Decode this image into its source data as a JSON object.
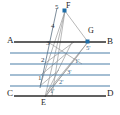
{
  "figure": {
    "width": 120,
    "height": 115,
    "background": "#ffffff",
    "colors": {
      "baseline": "#2b2b2b",
      "parallel": "#4a7fa8",
      "construction": "#8e8e8e",
      "marker": "#1f6ea8",
      "label": "#1a1a1a",
      "prime_label": "#2f5f86"
    },
    "baselines": [
      {
        "name": "line-AB",
        "left_label": "A",
        "right_label": "B",
        "y": 42,
        "x1": 14,
        "x2": 106,
        "color": "#2b2b2b",
        "width": 1.6
      },
      {
        "name": "line-CD",
        "left_label": "C",
        "right_label": "D",
        "y": 96,
        "x1": 14,
        "x2": 106,
        "color": "#2b2b2b",
        "width": 1.6
      }
    ],
    "parallels": [
      {
        "name": "parallel-1",
        "y": 53,
        "x1": 10,
        "x2": 110,
        "color": "#4a7fa8"
      },
      {
        "name": "parallel-2",
        "y": 64,
        "x1": 10,
        "x2": 110,
        "color": "#4a7fa8"
      },
      {
        "name": "parallel-3",
        "y": 75,
        "x1": 10,
        "x2": 110,
        "color": "#4a7fa8"
      },
      {
        "name": "parallel-4",
        "y": 86,
        "x1": 10,
        "x2": 110,
        "color": "#4a7fa8"
      }
    ],
    "points": [
      {
        "name": "point-F",
        "label": "F",
        "x": 65,
        "y": 11,
        "marked": true
      },
      {
        "name": "point-G",
        "label": "G",
        "x": 88,
        "y": 42,
        "marked": true
      },
      {
        "name": "point-E",
        "label": "E",
        "x": 45,
        "y": 96,
        "marked": false
      }
    ],
    "endpoint_labels": [
      {
        "name": "label-A",
        "text": "A",
        "x": 8,
        "y": 37
      },
      {
        "name": "label-B",
        "text": "B",
        "x": 107,
        "y": 38
      },
      {
        "name": "label-C",
        "text": "C",
        "x": 8,
        "y": 90
      },
      {
        "name": "label-D",
        "text": "D",
        "x": 107,
        "y": 90
      },
      {
        "name": "label-F",
        "text": "F",
        "x": 67,
        "y": 3
      },
      {
        "name": "label-G",
        "text": "G",
        "x": 89,
        "y": 28
      },
      {
        "name": "label-E",
        "text": "E",
        "x": 42,
        "y": 100
      }
    ],
    "division_labels": [
      {
        "name": "division-5",
        "text": "5",
        "x": 55,
        "y": 4
      },
      {
        "name": "division-4",
        "text": "4",
        "x": 52,
        "y": 24
      },
      {
        "name": "division-3",
        "text": "3",
        "x": 47,
        "y": 41
      },
      {
        "name": "division-2",
        "text": "2",
        "x": 42,
        "y": 58
      },
      {
        "name": "division-1",
        "text": "1",
        "x": 39,
        "y": 76
      }
    ],
    "prime_labels": [
      {
        "name": "division-5-prime",
        "text": "5'",
        "x": 87,
        "y": 46
      },
      {
        "name": "division-1-prime",
        "text": "1'",
        "x": 76,
        "y": 59
      },
      {
        "name": "division-3-prime",
        "text": "3'",
        "x": 68,
        "y": 70
      },
      {
        "name": "division-2-prime",
        "text": "2'",
        "x": 60,
        "y": 80
      },
      {
        "name": "division-1-prime-lower",
        "text": "1'",
        "x": 51,
        "y": 89
      }
    ],
    "construction_lines": [
      {
        "name": "line-F-to-E",
        "x1": 65,
        "y1": 11,
        "x2": 45,
        "y2": 97
      },
      {
        "name": "line-F-to-G",
        "x1": 65,
        "y1": 11,
        "x2": 88,
        "y2": 42
      },
      {
        "name": "line-F-down-left",
        "x1": 65,
        "y1": 11,
        "x2": 40,
        "y2": 86
      },
      {
        "name": "line-E-to-G",
        "x1": 45,
        "y1": 97,
        "x2": 88,
        "y2": 42
      },
      {
        "name": "line-E-up-right",
        "x1": 45,
        "y1": 97,
        "x2": 80,
        "y2": 53
      },
      {
        "name": "line-div3-to-G",
        "x1": 48,
        "y1": 42,
        "x2": 88,
        "y2": 42
      },
      {
        "name": "diag-cross-a",
        "x1": 48,
        "y1": 42,
        "x2": 80,
        "y2": 64
      },
      {
        "name": "diag-cross-b",
        "x1": 44,
        "y1": 64,
        "x2": 72,
        "y2": 42
      },
      {
        "name": "diag-cross-c",
        "x1": 41,
        "y1": 75,
        "x2": 66,
        "y2": 53
      },
      {
        "name": "diag-cross-d",
        "x1": 40,
        "y1": 86,
        "x2": 58,
        "y2": 70
      }
    ]
  }
}
